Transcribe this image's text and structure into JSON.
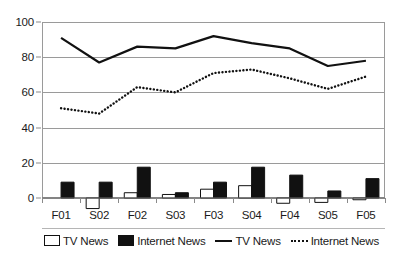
{
  "chart_data": {
    "type": "bar",
    "title": "",
    "subtitle": "",
    "xlabel": "",
    "ylabel": "",
    "ylim": [
      0,
      100
    ],
    "yticks": [
      0,
      20,
      40,
      60,
      80,
      100
    ],
    "grid": true,
    "legend_position": "bottom",
    "categories": [
      "F01",
      "S02",
      "F02",
      "S03",
      "F03",
      "S04",
      "F04",
      "S05",
      "F05"
    ],
    "series": [
      {
        "name": "TV News",
        "type": "bar",
        "style": "open",
        "values": [
          0,
          -6,
          3,
          2,
          5,
          7,
          -3,
          -2.5,
          -1
        ]
      },
      {
        "name": "Internet News",
        "type": "bar",
        "style": "filled",
        "values": [
          9,
          9,
          17.5,
          3,
          9,
          17.5,
          13,
          4,
          11
        ]
      },
      {
        "name": "TV News",
        "type": "line",
        "style": "solid",
        "values": [
          91,
          77,
          86,
          85,
          92,
          88,
          85,
          75,
          78
        ]
      },
      {
        "name": "Internet News",
        "type": "line",
        "style": "dotted",
        "values": [
          51,
          48,
          63,
          60,
          71,
          73,
          68,
          62,
          69
        ]
      }
    ]
  },
  "yaxis": {
    "ticks": [
      "0",
      "20",
      "40",
      "60",
      "80",
      "100"
    ]
  },
  "xaxis": {
    "labels": [
      "F01",
      "S02",
      "F02",
      "S03",
      "F03",
      "S04",
      "F04",
      "S05",
      "F05"
    ]
  },
  "legend": {
    "items": [
      {
        "label": "TV News",
        "marker": "open-bar-swatch"
      },
      {
        "label": "Internet News",
        "marker": "filled-bar-swatch"
      },
      {
        "label": "TV News",
        "marker": "solid-line-swatch"
      },
      {
        "label": "Internet News",
        "marker": "dotted-line-swatch"
      }
    ]
  },
  "colors": {
    "series_line": "#111111",
    "series_bar_fill": "#111111",
    "series_bar_open": "#ffffff",
    "grid": "#9a9a9a",
    "axis": "#8a8a8a",
    "background": "#ffffff"
  }
}
